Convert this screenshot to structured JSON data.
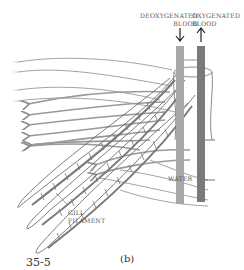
{
  "diagram": {
    "labels": {
      "deoxygenated_line1": "DEOXYGENATED",
      "deoxygenated_line2": "BLOOD",
      "oxygenated_line1": "OXYGENATED",
      "oxygenated_line2": "BLOOD",
      "water": "WATER",
      "gill_line1": "GILL",
      "gill_line2": "FILAMENT"
    },
    "panel_label": "(b)",
    "figure_number": "35-5",
    "colors": {
      "deoxygenated_vessel": "#a8a8a8",
      "oxygenated_vessel": "#7a7a7a",
      "water_flow": "#8c8c8c",
      "outline": "#6e6e6e"
    }
  }
}
